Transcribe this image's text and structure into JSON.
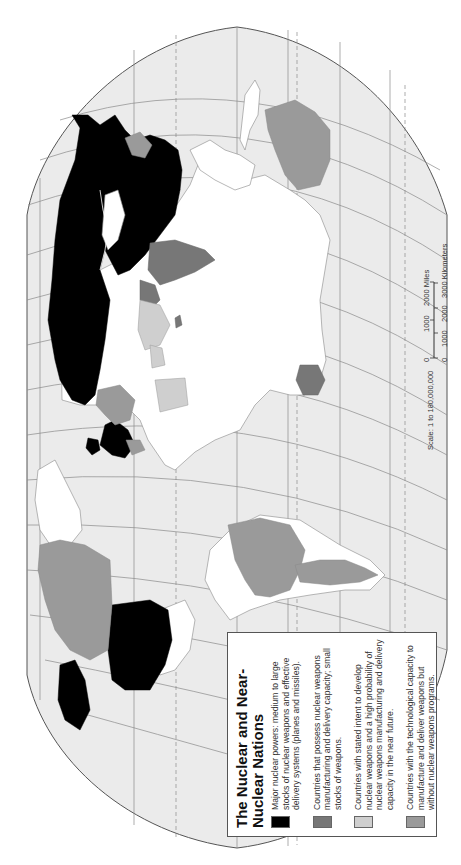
{
  "map": {
    "title": "The Nuclear and Near-Nuclear Nations",
    "orientation": "rotated 90 degrees counter-clockwise",
    "projection_outline": "robinson-like",
    "colors": {
      "ocean": "#ebebeb",
      "land_default": "#ffffff",
      "major_nuclear": "#000000",
      "possess_nuclear": "#777777",
      "stated_intent": "#cfcfcf",
      "technological_capacity": "#9a9a9a"
    }
  },
  "legend": {
    "title": "The Nuclear and Near-Nuclear Nations",
    "items": [
      {
        "swatch_color": "#000000",
        "label": "Major nuclear powers:  medium to large stocks of nuclear weapons and effective delivery systems (planes and missiles)."
      },
      {
        "swatch_color": "#777777",
        "label": "Countries that possess nuclear weapons manufacturing and delivery capacity; small stocks of weapons."
      },
      {
        "swatch_color": "#cfcfcf",
        "label": "Countries with stated intent to develop nuclear weapons and a high probability of nuclear  weapons manufacturing and delivery capacity in the near future."
      },
      {
        "swatch_color": "#9a9a9a",
        "label": "Countries with the technological capacity to manufacture and deliver weapons but without nuclear weapons programs."
      }
    ]
  },
  "scale": {
    "ratio_label": "Scale:  1 to 180,000,000",
    "miles_ticks": [
      "0",
      "1000",
      "2000 Miles"
    ],
    "km_ticks": [
      "0",
      "1000",
      "2000",
      "3000 Kilometers"
    ]
  },
  "regions": {
    "major_nuclear": [
      "United States",
      "Russia",
      "China",
      "France",
      "United Kingdom"
    ],
    "possess_nuclear": [
      "India",
      "Pakistan",
      "Israel"
    ],
    "stated_intent": [
      "Iran",
      "Iraq",
      "Libya"
    ],
    "technological_capacity": [
      "Canada",
      "Brazil",
      "Argentina",
      "Australia",
      "Japan",
      "South Africa",
      "Germany",
      "Sweden",
      "Italy"
    ]
  }
}
